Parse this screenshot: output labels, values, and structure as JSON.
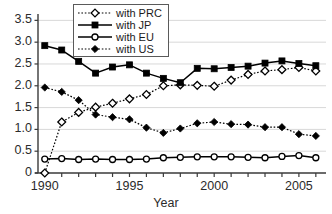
{
  "chart_data": {
    "type": "line",
    "title": "",
    "xlabel": "Year",
    "ylabel": "",
    "x": [
      1990,
      1991,
      1992,
      1993,
      1994,
      1995,
      1996,
      1997,
      1998,
      1999,
      2000,
      2001,
      2002,
      2003,
      2004,
      2005,
      2006
    ],
    "xlim": [
      1989.6,
      2006.6
    ],
    "ylim": [
      0,
      3.6
    ],
    "xticks": [
      1990,
      1995,
      2000,
      2005
    ],
    "xtick_labels": [
      "1990",
      "1995",
      "2000",
      "2005"
    ],
    "yticks": [
      0,
      0.5,
      1.0,
      1.5,
      2.0,
      2.5,
      3.0,
      3.5
    ],
    "ytick_labels": [
      "0",
      "0.5",
      "1.0",
      "1.5",
      "2.0",
      "2.5",
      "3.0",
      "3.5"
    ],
    "grid": true,
    "grid_axis": "y",
    "legend_position": "top-center",
    "series": [
      {
        "name": "with PRC",
        "legend_label": "with PRC",
        "marker": "open-diamond",
        "linestyle": "dotted",
        "color": "#000000",
        "values": [
          0.0,
          1.17,
          1.39,
          1.51,
          1.6,
          1.7,
          1.8,
          2.0,
          2.02,
          2.01,
          1.99,
          2.13,
          2.26,
          2.34,
          2.37,
          2.42,
          2.34
        ]
      },
      {
        "name": "with JP",
        "legend_label": "with JP",
        "marker": "filled-square",
        "linestyle": "solid",
        "color": "#000000",
        "values": [
          2.92,
          2.82,
          2.56,
          2.29,
          2.43,
          2.48,
          2.29,
          2.17,
          2.07,
          2.4,
          2.39,
          2.42,
          2.45,
          2.52,
          2.57,
          2.51,
          2.46
        ]
      },
      {
        "name": "with EU",
        "legend_label": "with EU",
        "marker": "open-circle",
        "linestyle": "solid",
        "color": "#000000",
        "values": [
          0.32,
          0.33,
          0.31,
          0.32,
          0.31,
          0.31,
          0.32,
          0.35,
          0.36,
          0.37,
          0.37,
          0.37,
          0.36,
          0.35,
          0.38,
          0.4,
          0.35
        ]
      },
      {
        "name": "with US",
        "legend_label": "with US",
        "marker": "filled-diamond",
        "linestyle": "dotted",
        "color": "#000000",
        "values": [
          1.96,
          1.86,
          1.67,
          1.34,
          1.28,
          1.23,
          1.04,
          0.92,
          1.02,
          1.14,
          1.17,
          1.12,
          1.11,
          1.05,
          1.05,
          0.89,
          0.85
        ]
      }
    ]
  },
  "axis": {
    "x_title": "Year"
  }
}
